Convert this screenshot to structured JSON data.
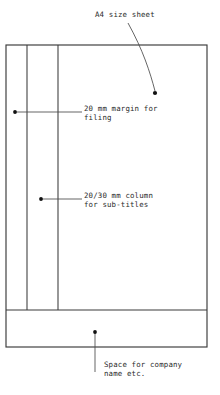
{
  "drawing": {
    "title": "A4 sheet layout with margins",
    "canvas": {
      "width": 220,
      "height": 395
    },
    "colors": {
      "background": "#ffffff",
      "line": "#3a3a3a",
      "leader": "#4a4a4a",
      "text": "#2b2b2b",
      "dot": "#101010"
    }
  },
  "annotations": {
    "sheet": {
      "label": "A4 size sheet",
      "text_x": 95,
      "text_y": 17,
      "dot_x": 155,
      "dot_y": 93
    },
    "margin": {
      "label_line1": "20 mm margin for",
      "label_line2": "filing",
      "text_x": 84,
      "text_y": 111,
      "dot_x": 15,
      "dot_y": 112
    },
    "column": {
      "label_line1": "20/30 mm column",
      "label_line2": "for sub-titles",
      "text_x": 84,
      "text_y": 198,
      "dot_x": 41,
      "dot_y": 199
    },
    "company": {
      "label_line1": "Space for company",
      "label_line2": "name etc.",
      "text_x": 104,
      "text_y": 367,
      "dot_x": 95,
      "dot_y": 332
    }
  },
  "geometry": {
    "outline": {
      "x": 6,
      "y": 45,
      "width": 201,
      "height": 302
    },
    "vertical_rules": [
      {
        "name": "filing-margin-rule",
        "x": 27,
        "y1": 45,
        "y2": 310
      },
      {
        "name": "sub-title-column-rule",
        "x": 58,
        "y1": 45,
        "y2": 310
      }
    ],
    "horizontal_rules": [
      {
        "name": "company-band-rule",
        "y": 310,
        "x1": 6,
        "x2": 207
      }
    ]
  }
}
